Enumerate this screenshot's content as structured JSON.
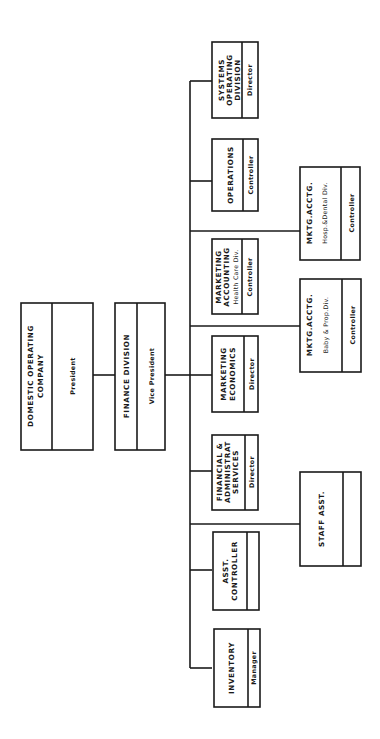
{
  "diagram": {
    "type": "org-chart",
    "orientation": "rotated-90-ccw",
    "nodes": {
      "domestic": {
        "title_lines": [
          "DOMESTIC OPERATING",
          "COMPANY"
        ],
        "role": "President"
      },
      "finance": {
        "title_lines": [
          "FINANCE DIVISION"
        ],
        "role": "Vice President"
      },
      "systems": {
        "title_lines": [
          "SYSTEMS",
          "OPERATING",
          "DIVISION"
        ],
        "role": "Director"
      },
      "operations": {
        "title_lines": [
          "OPERATIONS"
        ],
        "role": "Controller"
      },
      "mktg_accounting": {
        "title_lines": [
          "MARKETING",
          "ACCOUNTING"
        ],
        "sub": "Health Care Div.",
        "role": "Controller"
      },
      "mktg_economics": {
        "title_lines": [
          "MARKETING",
          "ECONOMICS"
        ],
        "role": "Director"
      },
      "fin_admin": {
        "title_lines": [
          "FINANCIAL &",
          "ADMINISTRAT",
          "SERVICES"
        ],
        "role": "Director"
      },
      "asst_controller": {
        "title_lines": [
          "ASST.",
          "CONTROLLER"
        ],
        "role": ""
      },
      "inventory": {
        "title_lines": [
          "INVENTORY"
        ],
        "role": "Manager"
      },
      "hosp_dental": {
        "title_lines": [
          "MKTG.ACCTG."
        ],
        "sub": "Hosp.&Dental Div.",
        "role": "Controller"
      },
      "baby_prop": {
        "title_lines": [
          "MKTG.ACCTG."
        ],
        "sub": "Baby & Prop.Div.",
        "role": "Controller"
      },
      "staff_asst": {
        "title_lines": [
          "STAFF ASST."
        ],
        "role": ""
      }
    },
    "edges": [
      [
        "domestic",
        "finance"
      ],
      [
        "finance",
        "systems"
      ],
      [
        "finance",
        "operations"
      ],
      [
        "finance",
        "mktg_accounting"
      ],
      [
        "finance",
        "mktg_economics"
      ],
      [
        "finance",
        "fin_admin"
      ],
      [
        "finance",
        "asst_controller"
      ],
      [
        "finance",
        "inventory"
      ],
      [
        "finance",
        "hosp_dental"
      ],
      [
        "finance",
        "baby_prop"
      ],
      [
        "finance",
        "staff_asst"
      ]
    ]
  }
}
